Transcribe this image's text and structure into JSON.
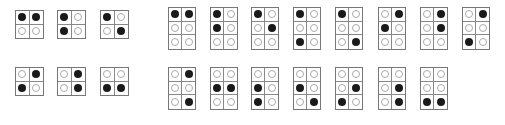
{
  "colors": {
    "filled": "#1a1a1a",
    "empty_outline": "#aaaaaa",
    "grid": "#777777"
  },
  "two_row_cells": [
    {
      "x": 15,
      "y": 10,
      "dots": [
        1,
        1,
        0,
        0
      ]
    },
    {
      "x": 57,
      "y": 10,
      "dots": [
        1,
        0,
        1,
        0
      ]
    },
    {
      "x": 100,
      "y": 10,
      "dots": [
        1,
        0,
        0,
        1
      ]
    },
    {
      "x": 15,
      "y": 67,
      "dots": [
        0,
        1,
        1,
        0
      ]
    },
    {
      "x": 57,
      "y": 67,
      "dots": [
        0,
        1,
        0,
        1
      ]
    },
    {
      "x": 100,
      "y": 67,
      "dots": [
        0,
        0,
        1,
        1
      ]
    }
  ],
  "three_row_cells": [
    {
      "x": 168,
      "y": 7,
      "dots": [
        1,
        1,
        0,
        0,
        0,
        0
      ]
    },
    {
      "x": 210,
      "y": 7,
      "dots": [
        1,
        0,
        1,
        0,
        0,
        0
      ]
    },
    {
      "x": 251,
      "y": 7,
      "dots": [
        1,
        0,
        0,
        1,
        0,
        0
      ]
    },
    {
      "x": 293,
      "y": 7,
      "dots": [
        1,
        0,
        0,
        0,
        1,
        0
      ]
    },
    {
      "x": 335,
      "y": 7,
      "dots": [
        1,
        0,
        0,
        0,
        0,
        1
      ]
    },
    {
      "x": 378,
      "y": 7,
      "dots": [
        0,
        1,
        1,
        0,
        0,
        0
      ]
    },
    {
      "x": 420,
      "y": 7,
      "dots": [
        0,
        1,
        0,
        1,
        0,
        0
      ]
    },
    {
      "x": 462,
      "y": 7,
      "dots": [
        0,
        1,
        0,
        0,
        1,
        0
      ]
    },
    {
      "x": 168,
      "y": 67,
      "dots": [
        0,
        1,
        0,
        0,
        0,
        1
      ]
    },
    {
      "x": 210,
      "y": 67,
      "dots": [
        0,
        0,
        1,
        1,
        0,
        0
      ]
    },
    {
      "x": 251,
      "y": 67,
      "dots": [
        0,
        0,
        1,
        0,
        1,
        0
      ]
    },
    {
      "x": 293,
      "y": 67,
      "dots": [
        0,
        0,
        1,
        0,
        0,
        1
      ]
    },
    {
      "x": 335,
      "y": 67,
      "dots": [
        0,
        0,
        0,
        1,
        1,
        0
      ]
    },
    {
      "x": 378,
      "y": 67,
      "dots": [
        0,
        0,
        0,
        1,
        0,
        1
      ]
    },
    {
      "x": 420,
      "y": 67,
      "dots": [
        0,
        0,
        0,
        0,
        1,
        1
      ]
    }
  ]
}
